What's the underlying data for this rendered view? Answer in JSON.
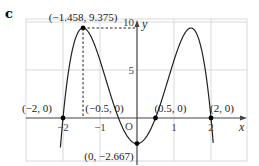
{
  "panel_label": "c",
  "chart_data": {
    "type": "line",
    "title": "",
    "function": "y = -2.667(x^2 - 4)(x^2 - 0.25)",
    "xlabel": "x",
    "ylabel": "y",
    "xlim": [
      -3,
      3
    ],
    "ylim": [
      -4.5,
      10
    ],
    "x_ticks": [
      -2,
      -1,
      1,
      2
    ],
    "x_tick_labels": [
      "−2",
      "−1",
      "1",
      "2"
    ],
    "y_ticks": [
      5,
      10
    ],
    "y_tick_labels": [
      "5",
      "10"
    ],
    "origin_label": "O",
    "grid": true,
    "legend": null,
    "points": [
      {
        "x": -2,
        "y": 0,
        "label": "(−2, 0)"
      },
      {
        "x": -0.5,
        "y": 0,
        "label": "(−0.5, 0)"
      },
      {
        "x": 0.5,
        "y": 0,
        "label": "(0.5, 0)"
      },
      {
        "x": 2,
        "y": 0,
        "label": "(2, 0)"
      },
      {
        "x": 0,
        "y": -2.667,
        "label": "(0, −2.667)"
      },
      {
        "x": -1.458,
        "y": 9.375,
        "label": "(−1.458, 9.375)"
      }
    ],
    "annotations": [
      {
        "type": "dashed-guide",
        "from": [
          -1.458,
          9.375
        ],
        "to": [
          -1.458,
          0
        ]
      },
      {
        "type": "dashed-guide",
        "from": [
          -1.458,
          9.375
        ],
        "to": [
          0,
          9.375
        ]
      }
    ]
  }
}
